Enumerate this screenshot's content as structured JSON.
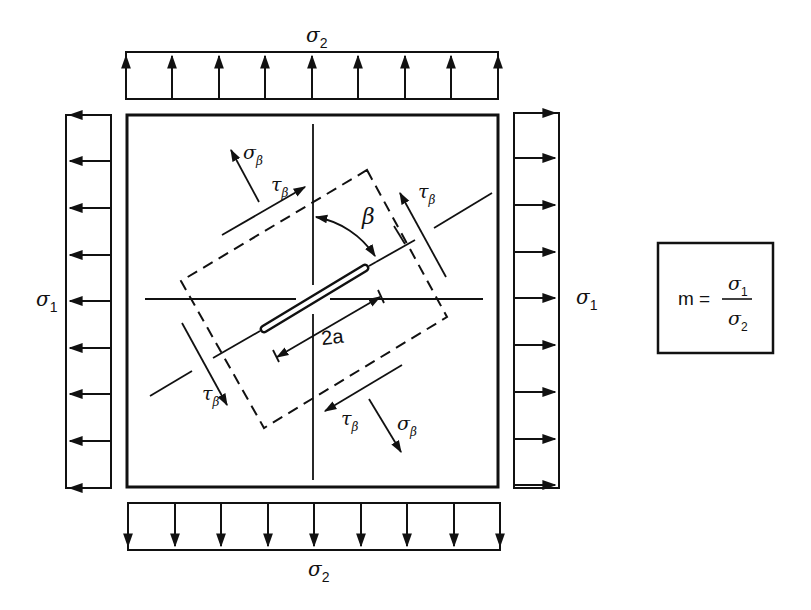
{
  "figure": {
    "ink_color": "#111111",
    "background": "#ffffff"
  },
  "labels": {
    "sigma_top": {
      "symbol": "σ",
      "sub": "2"
    },
    "sigma_bottom": {
      "symbol": "σ",
      "sub": "2"
    },
    "sigma_left": {
      "symbol": "σ",
      "sub": "1"
    },
    "sigma_right": {
      "symbol": "σ",
      "sub": "1"
    },
    "sigma_beta_upper": {
      "symbol": "σ",
      "sub": "β"
    },
    "sigma_beta_lower": {
      "symbol": "σ",
      "sub": "β"
    },
    "tau_beta_upper_left": {
      "symbol": "τ",
      "sub": "β"
    },
    "tau_beta_upper_right": {
      "symbol": "τ",
      "sub": "β"
    },
    "tau_beta_lower_left": {
      "symbol": "τ",
      "sub": "β"
    },
    "tau_beta_lower_right": {
      "symbol": "τ",
      "sub": "β"
    },
    "angle": "β",
    "crack_length": "2a"
  },
  "formula_box": {
    "lhs": "m =",
    "numerator": {
      "symbol": "σ",
      "sub": "1"
    },
    "denominator": {
      "symbol": "σ",
      "sub": "2"
    }
  },
  "loads": {
    "top": {
      "direction": "up",
      "arrow_count": 9
    },
    "bottom": {
      "direction": "down",
      "arrow_count": 9
    },
    "left": {
      "direction": "left",
      "arrow_count": 9
    },
    "right": {
      "direction": "right",
      "arrow_count": 9
    }
  }
}
